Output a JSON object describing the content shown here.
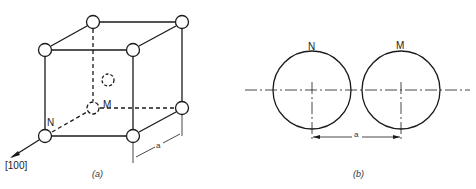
{
  "figure_a": {
    "caption": "(a)",
    "direction_label": "[100]",
    "atom_labels": {
      "n": "N",
      "m": "M"
    },
    "dimension_label": "a"
  },
  "figure_b": {
    "caption": "(b)",
    "atom_labels": {
      "n": "N",
      "m": "M"
    },
    "dimension_label": "a"
  },
  "colors": {
    "line": "#1a1a1a",
    "background": "#ffffff"
  }
}
